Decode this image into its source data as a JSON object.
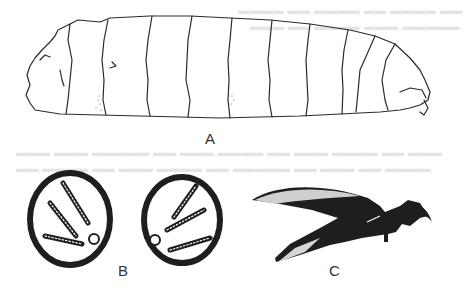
{
  "figure": {
    "panels": [
      {
        "id": "A",
        "label": "A",
        "subject": "larva-lateral-view"
      },
      {
        "id": "B",
        "label": "B",
        "subject": "posterior-spiracles-pair"
      },
      {
        "id": "C",
        "label": "C",
        "subject": "cephalopharyngeal-skeleton"
      }
    ]
  },
  "colors": {
    "ink": "#2a2a2a",
    "paper": "#ffffff",
    "bleed_text": "#e4e4e4"
  }
}
